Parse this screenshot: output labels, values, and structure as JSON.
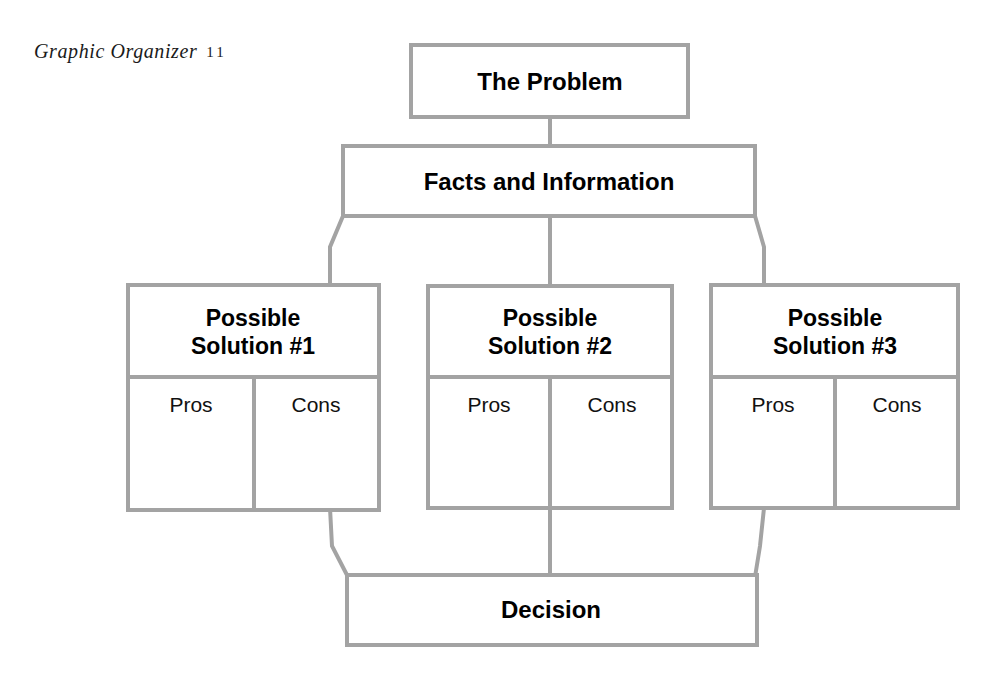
{
  "page": {
    "title_prefix": "Graphic Organizer",
    "title_number": "11",
    "background_color": "#ffffff",
    "line_color": "#a3a3a3",
    "text_color": "#000000"
  },
  "diagram": {
    "type": "flowchart",
    "problem_box": {
      "label": "The Problem",
      "x": 411,
      "y": 45,
      "w": 277,
      "h": 72
    },
    "facts_box": {
      "label": "Facts and Information",
      "x": 343,
      "y": 146,
      "w": 412,
      "h": 70
    },
    "solutions": [
      {
        "label_line1": "Possible",
        "label_line2": "Solution #1",
        "pros_label": "Pros",
        "cons_label": "Cons",
        "x": 128,
        "y": 285,
        "w": 251,
        "h": 225
      },
      {
        "label_line1": "Possible",
        "label_line2": "Solution #2",
        "pros_label": "Pros",
        "cons_label": "Cons",
        "x": 428,
        "y": 286,
        "w": 244,
        "h": 222
      },
      {
        "label_line1": "Possible",
        "label_line2": "Solution #3",
        "pros_label": "Pros",
        "cons_label": "Cons",
        "x": 711,
        "y": 285,
        "w": 247,
        "h": 223
      }
    ],
    "decision_box": {
      "label": "Decision",
      "x": 347,
      "y": 575,
      "w": 410,
      "h": 70
    },
    "connectors": [
      {
        "name": "problem-to-facts",
        "kind": "vertical"
      },
      {
        "name": "facts-to-solution-1",
        "kind": "diagonal"
      },
      {
        "name": "facts-to-solution-2",
        "kind": "vertical"
      },
      {
        "name": "facts-to-solution-3",
        "kind": "diagonal"
      },
      {
        "name": "solution-1-to-decision",
        "kind": "diagonal"
      },
      {
        "name": "solution-2-to-decision",
        "kind": "vertical"
      },
      {
        "name": "solution-3-to-decision",
        "kind": "diagonal"
      }
    ]
  }
}
